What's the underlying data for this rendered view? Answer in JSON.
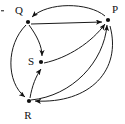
{
  "diagram": {
    "type": "directed-graph",
    "title": "",
    "background_color": "#ffffff",
    "edge_color": "#1a1a1a",
    "node_color": "#111111",
    "nodes": [
      {
        "id": "Q",
        "label": "Q",
        "x": 28,
        "y": 22,
        "label_x": 19,
        "label_y": 14
      },
      {
        "id": "P",
        "label": "P",
        "x": 108,
        "y": 20,
        "label_x": 113,
        "label_y": 13
      },
      {
        "id": "S",
        "label": "S",
        "x": 41,
        "y": 62,
        "label_x": 30,
        "label_y": 62
      },
      {
        "id": "R",
        "label": "R",
        "x": 29,
        "y": 101,
        "label_x": 25,
        "label_y": 117
      }
    ],
    "edges": [
      {
        "from": "P",
        "to": "Q",
        "shape": "arc-top"
      },
      {
        "from": "Q",
        "to": "P",
        "shape": "straight"
      },
      {
        "from": "Q",
        "to": "R",
        "shape": "arc-left"
      },
      {
        "from": "Q",
        "to": "S",
        "shape": "curve-down"
      },
      {
        "from": "R",
        "to": "S",
        "shape": "curve-up"
      },
      {
        "from": "S",
        "to": "P",
        "shape": "curve-right"
      },
      {
        "from": "R",
        "to": "P",
        "shape": "arc-outer-right"
      },
      {
        "from": "P",
        "to": "R",
        "shape": "curve-lower"
      }
    ]
  }
}
